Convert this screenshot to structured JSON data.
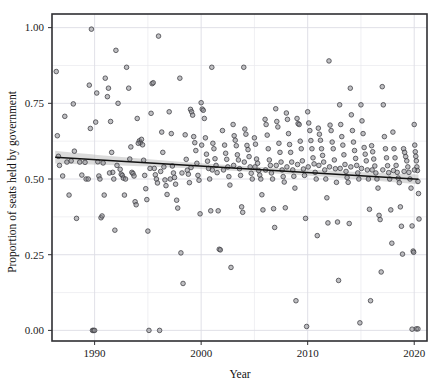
{
  "chart_data": {
    "type": "scatter",
    "title": "",
    "xlabel": "Year",
    "ylabel": "Proportion of seats held by government",
    "xlim": [
      1986.0,
      2021.2
    ],
    "ylim": [
      -0.035,
      1.045
    ],
    "xticks": [
      1990,
      2000,
      2010,
      2020
    ],
    "xtick_labels": [
      "1990",
      "2000",
      "2010",
      "2020"
    ],
    "yticks": [
      0.0,
      0.25,
      0.5,
      0.75,
      1.0
    ],
    "ytick_labels": [
      "0.00",
      "0.25",
      "0.50",
      "0.75",
      "1.00"
    ],
    "minor_yticks": [
      0.125,
      0.375,
      0.625,
      0.875
    ],
    "minor_xticks": [
      1995,
      2005,
      2015
    ],
    "grid": true,
    "legend": null,
    "point_color": "#8a8a8f",
    "point_edge_color": "#3c3c42",
    "point_radius": 2.3,
    "point_opacity": 0.85,
    "trend": {
      "type": "linear-fit",
      "line_color": "#111111",
      "band_color": "#b8b8b8",
      "band_opacity": 0.5,
      "x_start": 1986.3,
      "x_end": 2020.4,
      "y_start": 0.572,
      "y_end": 0.499,
      "band_halfwidth_start": 0.021,
      "band_halfwidth_mid": 0.009,
      "band_halfwidth_end": 0.016
    },
    "points": [
      [
        1986.4,
        0.855
      ],
      [
        1986.5,
        0.643
      ],
      [
        1986.6,
        0.575
      ],
      [
        1986.7,
        0.545
      ],
      [
        1987.0,
        0.51
      ],
      [
        1987.2,
        0.707
      ],
      [
        1987.4,
        0.556
      ],
      [
        1987.6,
        0.447
      ],
      [
        1988.0,
        0.748
      ],
      [
        1988.3,
        0.37
      ],
      [
        1988.6,
        0.556
      ],
      [
        1988.8,
        0.513
      ],
      [
        1989.2,
        0.5
      ],
      [
        1989.4,
        0.5
      ],
      [
        1989.5,
        0.81
      ],
      [
        1989.6,
        0.667
      ],
      [
        1989.7,
        0.995
      ],
      [
        1989.8,
        0.0
      ],
      [
        1989.9,
        0.0
      ],
      [
        1990.0,
        0.0
      ],
      [
        1990.1,
        0.688
      ],
      [
        1990.2,
        0.784
      ],
      [
        1990.3,
        0.557
      ],
      [
        1990.4,
        0.51
      ],
      [
        1990.5,
        0.5
      ],
      [
        1990.6,
        0.372
      ],
      [
        1990.7,
        0.378
      ],
      [
        1990.9,
        0.447
      ],
      [
        1991.0,
        0.833
      ],
      [
        1991.2,
        0.772
      ],
      [
        1991.3,
        0.8
      ],
      [
        1991.5,
        0.69
      ],
      [
        1991.6,
        0.588
      ],
      [
        1991.7,
        0.522
      ],
      [
        1991.8,
        0.5
      ],
      [
        1991.9,
        0.331
      ],
      [
        1992.0,
        0.925
      ],
      [
        1992.2,
        0.75
      ],
      [
        1992.4,
        0.532
      ],
      [
        1992.5,
        0.516
      ],
      [
        1992.6,
        0.512
      ],
      [
        1992.7,
        0.503
      ],
      [
        1992.8,
        0.447
      ],
      [
        1993.0,
        0.869
      ],
      [
        1993.2,
        0.8
      ],
      [
        1993.4,
        0.606
      ],
      [
        1993.5,
        0.522
      ],
      [
        1993.6,
        0.518
      ],
      [
        1993.7,
        0.51
      ],
      [
        1993.8,
        0.425
      ],
      [
        1993.9,
        0.415
      ],
      [
        1994.0,
        0.7
      ],
      [
        1994.2,
        0.626
      ],
      [
        1994.3,
        0.62
      ],
      [
        1994.4,
        0.631
      ],
      [
        1994.5,
        0.613
      ],
      [
        1994.6,
        0.562
      ],
      [
        1994.7,
        0.512
      ],
      [
        1994.8,
        0.468
      ],
      [
        1994.9,
        0.432
      ],
      [
        1995.0,
        0.328
      ],
      [
        1995.1,
        0.0
      ],
      [
        1995.3,
        0.717
      ],
      [
        1995.4,
        0.815
      ],
      [
        1995.5,
        0.818
      ],
      [
        1995.6,
        0.535
      ],
      [
        1995.7,
        0.514
      ],
      [
        1995.8,
        0.5
      ],
      [
        1995.9,
        0.487
      ],
      [
        1996.0,
        0.972
      ],
      [
        1996.1,
        0.0
      ],
      [
        1996.3,
        0.655
      ],
      [
        1996.4,
        0.588
      ],
      [
        1996.5,
        0.54
      ],
      [
        1996.6,
        0.497
      ],
      [
        1996.7,
        0.478
      ],
      [
        1996.8,
        0.449
      ],
      [
        1997.0,
        0.722
      ],
      [
        1997.2,
        0.65
      ],
      [
        1997.3,
        0.543
      ],
      [
        1997.4,
        0.52
      ],
      [
        1997.5,
        0.505
      ],
      [
        1997.6,
        0.483
      ],
      [
        1997.7,
        0.43
      ],
      [
        1997.8,
        0.404
      ],
      [
        1998.0,
        0.833
      ],
      [
        1998.1,
        0.256
      ],
      [
        1998.3,
        0.155
      ],
      [
        1998.5,
        0.646
      ],
      [
        1998.6,
        0.565
      ],
      [
        1998.7,
        0.529
      ],
      [
        1998.8,
        0.516
      ],
      [
        1998.9,
        0.488
      ],
      [
        1999.0,
        0.73
      ],
      [
        1999.1,
        0.722
      ],
      [
        1999.2,
        0.711
      ],
      [
        1999.3,
        0.64
      ],
      [
        1999.4,
        0.62
      ],
      [
        1999.5,
        0.594
      ],
      [
        1999.6,
        0.552
      ],
      [
        1999.7,
        0.512
      ],
      [
        1999.8,
        0.496
      ],
      [
        1999.9,
        0.385
      ],
      [
        2000.0,
        0.752
      ],
      [
        2000.1,
        0.731
      ],
      [
        2000.2,
        0.727
      ],
      [
        2000.3,
        0.7
      ],
      [
        2000.4,
        0.636
      ],
      [
        2000.5,
        0.582
      ],
      [
        2000.6,
        0.559
      ],
      [
        2000.7,
        0.535
      ],
      [
        2000.8,
        0.5
      ],
      [
        2000.9,
        0.395
      ],
      [
        2001.0,
        0.869
      ],
      [
        2001.1,
        0.618
      ],
      [
        2001.2,
        0.6
      ],
      [
        2001.3,
        0.567
      ],
      [
        2001.4,
        0.545
      ],
      [
        2001.5,
        0.521
      ],
      [
        2001.6,
        0.395
      ],
      [
        2001.7,
        0.268
      ],
      [
        2001.8,
        0.266
      ],
      [
        2002.0,
        0.66
      ],
      [
        2002.2,
        0.612
      ],
      [
        2002.3,
        0.585
      ],
      [
        2002.4,
        0.565
      ],
      [
        2002.5,
        0.54
      ],
      [
        2002.6,
        0.508
      ],
      [
        2002.7,
        0.48
      ],
      [
        2002.8,
        0.208
      ],
      [
        2003.0,
        0.68
      ],
      [
        2003.1,
        0.643
      ],
      [
        2003.2,
        0.628
      ],
      [
        2003.3,
        0.61
      ],
      [
        2003.4,
        0.58
      ],
      [
        2003.5,
        0.563
      ],
      [
        2003.6,
        0.534
      ],
      [
        2003.7,
        0.512
      ],
      [
        2003.8,
        0.408
      ],
      [
        2003.9,
        0.39
      ],
      [
        2004.0,
        0.869
      ],
      [
        2004.1,
        0.665
      ],
      [
        2004.2,
        0.648
      ],
      [
        2004.3,
        0.611
      ],
      [
        2004.4,
        0.597
      ],
      [
        2004.5,
        0.574
      ],
      [
        2004.6,
        0.54
      ],
      [
        2004.7,
        0.519
      ],
      [
        2004.8,
        0.5
      ],
      [
        2005.0,
        0.636
      ],
      [
        2005.1,
        0.615
      ],
      [
        2005.2,
        0.566
      ],
      [
        2005.3,
        0.552
      ],
      [
        2005.4,
        0.528
      ],
      [
        2005.5,
        0.513
      ],
      [
        2005.6,
        0.5
      ],
      [
        2005.7,
        0.448
      ],
      [
        2005.8,
        0.398
      ],
      [
        2006.0,
        0.697
      ],
      [
        2006.1,
        0.68
      ],
      [
        2006.2,
        0.645
      ],
      [
        2006.3,
        0.6
      ],
      [
        2006.4,
        0.563
      ],
      [
        2006.5,
        0.545
      ],
      [
        2006.6,
        0.52
      ],
      [
        2006.7,
        0.5
      ],
      [
        2006.8,
        0.402
      ],
      [
        2006.9,
        0.34
      ],
      [
        2007.0,
        0.732
      ],
      [
        2007.1,
        0.69
      ],
      [
        2007.2,
        0.672
      ],
      [
        2007.3,
        0.618
      ],
      [
        2007.4,
        0.588
      ],
      [
        2007.5,
        0.556
      ],
      [
        2007.6,
        0.53
      ],
      [
        2007.7,
        0.508
      ],
      [
        2007.8,
        0.49
      ],
      [
        2007.9,
        0.405
      ],
      [
        2008.0,
        0.718
      ],
      [
        2008.1,
        0.697
      ],
      [
        2008.2,
        0.65
      ],
      [
        2008.3,
        0.614
      ],
      [
        2008.4,
        0.588
      ],
      [
        2008.5,
        0.556
      ],
      [
        2008.6,
        0.53
      ],
      [
        2008.7,
        0.509
      ],
      [
        2008.8,
        0.47
      ],
      [
        2008.9,
        0.098
      ],
      [
        2009.0,
        0.7
      ],
      [
        2009.1,
        0.683
      ],
      [
        2009.2,
        0.68
      ],
      [
        2009.3,
        0.625
      ],
      [
        2009.4,
        0.6
      ],
      [
        2009.5,
        0.56
      ],
      [
        2009.6,
        0.533
      ],
      [
        2009.7,
        0.512
      ],
      [
        2009.8,
        0.37
      ],
      [
        2009.9,
        0.013
      ],
      [
        2010.0,
        0.722
      ],
      [
        2010.1,
        0.685
      ],
      [
        2010.2,
        0.66
      ],
      [
        2010.3,
        0.627
      ],
      [
        2010.4,
        0.6
      ],
      [
        2010.5,
        0.57
      ],
      [
        2010.6,
        0.55
      ],
      [
        2010.7,
        0.522
      ],
      [
        2010.8,
        0.5
      ],
      [
        2010.9,
        0.313
      ],
      [
        2011.0,
        0.668
      ],
      [
        2011.1,
        0.648
      ],
      [
        2011.2,
        0.628
      ],
      [
        2011.3,
        0.6
      ],
      [
        2011.4,
        0.578
      ],
      [
        2011.5,
        0.556
      ],
      [
        2011.6,
        0.53
      ],
      [
        2011.7,
        0.5
      ],
      [
        2011.8,
        0.438
      ],
      [
        2011.9,
        0.355
      ],
      [
        2012.0,
        0.89
      ],
      [
        2012.1,
        0.678
      ],
      [
        2012.2,
        0.66
      ],
      [
        2012.3,
        0.622
      ],
      [
        2012.4,
        0.6
      ],
      [
        2012.5,
        0.563
      ],
      [
        2012.6,
        0.534
      ],
      [
        2012.7,
        0.489
      ],
      [
        2012.8,
        0.358
      ],
      [
        2012.9,
        0.165
      ],
      [
        2013.0,
        0.745
      ],
      [
        2013.1,
        0.68
      ],
      [
        2013.2,
        0.64
      ],
      [
        2013.3,
        0.612
      ],
      [
        2013.4,
        0.58
      ],
      [
        2013.5,
        0.548
      ],
      [
        2013.6,
        0.525
      ],
      [
        2013.7,
        0.505
      ],
      [
        2013.8,
        0.489
      ],
      [
        2013.9,
        0.353
      ],
      [
        2014.0,
        0.8
      ],
      [
        2014.1,
        0.712
      ],
      [
        2014.2,
        0.66
      ],
      [
        2014.3,
        0.622
      ],
      [
        2014.4,
        0.594
      ],
      [
        2014.5,
        0.568
      ],
      [
        2014.6,
        0.545
      ],
      [
        2014.7,
        0.52
      ],
      [
        2014.8,
        0.5
      ],
      [
        2014.9,
        0.025
      ],
      [
        2015.0,
        0.745
      ],
      [
        2015.1,
        0.692
      ],
      [
        2015.2,
        0.65
      ],
      [
        2015.3,
        0.604
      ],
      [
        2015.4,
        0.582
      ],
      [
        2015.5,
        0.56
      ],
      [
        2015.6,
        0.53
      ],
      [
        2015.7,
        0.5
      ],
      [
        2015.8,
        0.4
      ],
      [
        2015.9,
        0.098
      ],
      [
        2016.0,
        0.61
      ],
      [
        2016.1,
        0.59
      ],
      [
        2016.2,
        0.566
      ],
      [
        2016.3,
        0.543
      ],
      [
        2016.4,
        0.52
      ],
      [
        2016.5,
        0.5
      ],
      [
        2016.6,
        0.47
      ],
      [
        2016.7,
        0.38
      ],
      [
        2016.8,
        0.366
      ],
      [
        2016.9,
        0.193
      ],
      [
        2017.0,
        0.805
      ],
      [
        2017.1,
        0.745
      ],
      [
        2017.2,
        0.64
      ],
      [
        2017.3,
        0.6
      ],
      [
        2017.4,
        0.57
      ],
      [
        2017.5,
        0.544
      ],
      [
        2017.6,
        0.521
      ],
      [
        2017.7,
        0.5
      ],
      [
        2017.8,
        0.398
      ],
      [
        2017.9,
        0.288
      ],
      [
        2018.0,
        0.655
      ],
      [
        2018.1,
        0.6
      ],
      [
        2018.2,
        0.57
      ],
      [
        2018.3,
        0.545
      ],
      [
        2018.4,
        0.522
      ],
      [
        2018.5,
        0.503
      ],
      [
        2018.6,
        0.488
      ],
      [
        2018.7,
        0.408
      ],
      [
        2018.8,
        0.344
      ],
      [
        2018.9,
        0.252
      ],
      [
        2019.0,
        0.6
      ],
      [
        2019.1,
        0.588
      ],
      [
        2019.2,
        0.574
      ],
      [
        2019.3,
        0.56
      ],
      [
        2019.4,
        0.54
      ],
      [
        2019.5,
        0.522
      ],
      [
        2019.6,
        0.5
      ],
      [
        2019.7,
        0.47
      ],
      [
        2019.8,
        0.345
      ],
      [
        2019.9,
        0.262
      ],
      [
        2019.95,
        0.258
      ],
      [
        2020.0,
        0.68
      ],
      [
        2020.05,
        0.612
      ],
      [
        2020.1,
        0.59
      ],
      [
        2020.15,
        0.575
      ],
      [
        2020.2,
        0.56
      ],
      [
        2020.25,
        0.54
      ],
      [
        2020.3,
        0.528
      ],
      [
        2020.35,
        0.492
      ],
      [
        2020.4,
        0.452
      ],
      [
        2020.45,
        0.368
      ],
      [
        2020.2,
        0.005
      ],
      [
        2020.35,
        0.005
      ],
      [
        2019.8,
        0.004
      ],
      [
        1987.8,
        0.56
      ],
      [
        1988.1,
        0.592
      ],
      [
        1989.1,
        0.555
      ],
      [
        1990.8,
        0.553
      ],
      [
        1991.4,
        0.52
      ],
      [
        1992.1,
        0.545
      ],
      [
        1992.9,
        0.5
      ],
      [
        1993.3,
        0.566
      ],
      [
        1994.1,
        0.618
      ],
      [
        1995.2,
        0.535
      ],
      [
        1996.2,
        0.525
      ],
      [
        1997.1,
        0.5
      ],
      [
        1998.2,
        0.52
      ],
      [
        1999.05,
        0.538
      ],
      [
        2000.05,
        0.612
      ],
      [
        2001.05,
        0.53
      ],
      [
        2002.1,
        0.53
      ],
      [
        2003.05,
        0.545
      ],
      [
        2004.05,
        0.556
      ],
      [
        2005.05,
        0.54
      ],
      [
        2006.05,
        0.53
      ],
      [
        2007.05,
        0.545
      ],
      [
        2008.05,
        0.54
      ],
      [
        2009.05,
        0.548
      ],
      [
        2010.05,
        0.54
      ],
      [
        2011.05,
        0.545
      ],
      [
        2012.05,
        0.54
      ],
      [
        2013.05,
        0.535
      ],
      [
        2014.05,
        0.54
      ],
      [
        2015.05,
        0.535
      ],
      [
        2016.05,
        0.53
      ],
      [
        2017.05,
        0.53
      ],
      [
        2018.05,
        0.528
      ],
      [
        2019.05,
        0.525
      ],
      [
        2020.02,
        0.53
      ]
    ]
  },
  "axes": {
    "x_title": "Year",
    "y_title": "Proportion of seats held by government"
  }
}
